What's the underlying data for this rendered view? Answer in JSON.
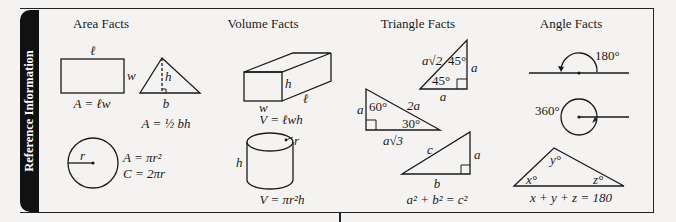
{
  "sidebar": {
    "label": "Reference Information"
  },
  "sections": {
    "area": {
      "title": "Area Facts",
      "rectangle": {
        "length_label": "ℓ",
        "width_label": "w",
        "formula": "A = ℓw"
      },
      "triangle": {
        "height_label": "h",
        "base_label": "b",
        "formula": "A = ½ bh"
      },
      "circle": {
        "radius_label": "r",
        "area_formula": "A = πr²",
        "circumference_formula": "C = 2πr"
      }
    },
    "volume": {
      "title": "Volume Facts",
      "box": {
        "height_label": "h",
        "length_label": "ℓ",
        "width_label": "w",
        "formula": "V = ℓwh"
      },
      "cylinder": {
        "radius_label": "r",
        "height_label": "h",
        "formula": "V = πr²h"
      }
    },
    "triangle": {
      "title": "Triangle Facts",
      "isosceles_right": {
        "hypotenuse": "a√2",
        "leg_vertical": "a",
        "leg_horizontal": "a",
        "angle_top": "45°",
        "angle_bottom": "45°"
      },
      "thirty_sixty": {
        "short_leg": "a",
        "hypotenuse": "2a",
        "long_leg": "a√3",
        "angle_top": "60°",
        "angle_bottom": "30°"
      },
      "pythagorean": {
        "hypotenuse": "c",
        "leg_vertical": "a",
        "leg_horizontal": "b",
        "formula": "a² + b² = c²"
      }
    },
    "angle": {
      "title": "Angle Facts",
      "straight": {
        "label": "180°"
      },
      "full": {
        "label": "360°"
      },
      "triangle": {
        "x": "x°",
        "y": "y°",
        "z": "z°",
        "formula": "x + y + z = 180"
      }
    }
  }
}
